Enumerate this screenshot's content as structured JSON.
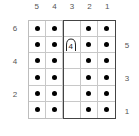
{
  "chart": {
    "columns": [
      "5",
      "4",
      "3",
      "2",
      "1"
    ],
    "rows_left": [
      "6",
      "",
      "4",
      "",
      "2",
      ""
    ],
    "rows_right": [
      "",
      "5",
      "",
      "3",
      "",
      "1"
    ],
    "cells": [
      [
        "dot",
        "dot",
        "empty",
        "dot",
        "dot"
      ],
      [
        "dot",
        "dot",
        "arch",
        "dot",
        "dot"
      ],
      [
        "dot",
        "dot",
        "empty",
        "dot",
        "dot"
      ],
      [
        "dot",
        "dot",
        "empty",
        "dot",
        "dot"
      ],
      [
        "dot",
        "dot",
        "empty",
        "dot",
        "dot"
      ],
      [
        "dot",
        "dot",
        "empty",
        "dot",
        "dot"
      ]
    ],
    "arch_symbol": {
      "label": "4",
      "row": 5,
      "column": 3
    },
    "repeat_box": {
      "from_column": 3,
      "to_column": 1
    },
    "colors": {
      "dot": "#000000",
      "grid": "#c8c8c8",
      "repeat_border": "#444444",
      "labels": "#555555"
    }
  }
}
